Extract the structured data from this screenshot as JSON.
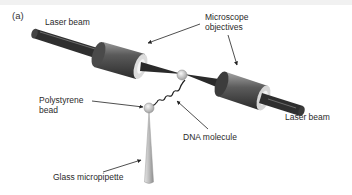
{
  "figure": {
    "panel_label": "(a)",
    "labels": {
      "laser_beam_left": "Laser beam",
      "microscope_objectives_line1": "Microscope",
      "microscope_objectives_line2": "objectives",
      "polystyrene_bead_line1": "Polystyrene",
      "polystyrene_bead_line2": "bead",
      "dna_molecule": "DNA molecule",
      "laser_beam_right": "Laser beam",
      "glass_micropipette": "Glass micropipette"
    },
    "colors": {
      "beam": "#2e2e2e",
      "objective_dark": "#3a3a3a",
      "objective_light": "#d8d8d8",
      "bead": "#e2e2e2",
      "pipette": "#c8c8c8",
      "arrow": "#222222"
    }
  }
}
